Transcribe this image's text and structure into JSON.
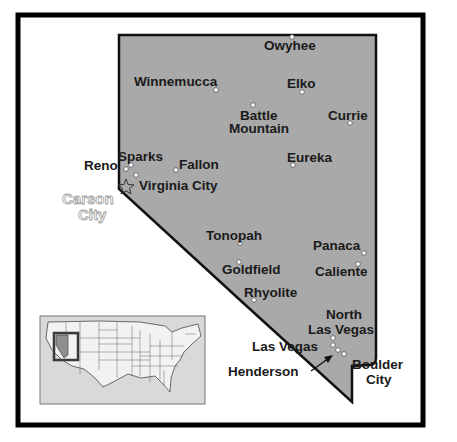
{
  "map": {
    "title": "Nevada",
    "capital": {
      "name_line1": "Carson",
      "name_line2": "City",
      "icon": "star-icon"
    },
    "cities": [
      {
        "name": "Owyhee",
        "x": 292,
        "y": 36
      },
      {
        "name": "Winnemucca",
        "x": 216,
        "y": 90
      },
      {
        "name": "Elko",
        "x": 302,
        "y": 92
      },
      {
        "name": "Battle",
        "x": 253,
        "y": 104
      },
      {
        "name": "Currie",
        "x": 350,
        "y": 123
      },
      {
        "name": "Eureka",
        "x": 293,
        "y": 165
      },
      {
        "name": "Sparks",
        "x": 131,
        "y": 166
      },
      {
        "name": "Reno",
        "x": 125,
        "y": 169
      },
      {
        "name": "Fallon",
        "x": 175,
        "y": 170
      },
      {
        "name": "Virginia City",
        "x": 135,
        "y": 175
      },
      {
        "name": "Tonopah",
        "x": 240,
        "y": 243
      },
      {
        "name": "Goldfield",
        "x": 239,
        "y": 262
      },
      {
        "name": "Rhyolite",
        "x": 254,
        "y": 300
      },
      {
        "name": "Panaca",
        "x": 364,
        "y": 253
      },
      {
        "name": "Caliente",
        "x": 358,
        "y": 264
      },
      {
        "name": "North Las Vegas",
        "x": 333,
        "y": 338
      },
      {
        "name": "Las Vegas",
        "x": 333,
        "y": 345
      },
      {
        "name": "Henderson",
        "x": 338,
        "y": 350
      },
      {
        "name": "Boulder City",
        "x": 344,
        "y": 354
      }
    ],
    "labels": {
      "owyhee": "Owyhee",
      "winnemucca": "Winnemucca",
      "elko": "Elko",
      "battle_mountain_1": "Battle",
      "battle_mountain_2": "Mountain",
      "currie": "Currie",
      "eureka": "Eureka",
      "sparks": "Sparks",
      "reno": "Reno",
      "fallon": "Fallon",
      "virginia_city": "Virginia City",
      "tonopah": "Tonopah",
      "goldfield": "Goldfield",
      "rhyolite": "Rhyolite",
      "panaca": "Panaca",
      "caliente": "Caliente",
      "north_las_vegas_1": "North",
      "north_las_vegas_2": "Las Vegas",
      "las_vegas": "Las Vegas",
      "henderson": "Henderson",
      "boulder_city_1": "Boulder",
      "boulder_city_2": "City"
    },
    "inset": {
      "description": "US locator map with Nevada highlighted"
    },
    "colors": {
      "state_fill": "#a9a9a9",
      "frame": "#000000",
      "inset_bg": "#d9d9d9",
      "highlight": "#3a3a3a"
    }
  }
}
